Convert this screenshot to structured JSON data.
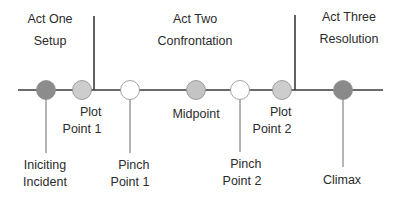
{
  "acts": [
    {
      "title": "Act One",
      "subtitle": "Setup"
    },
    {
      "title": "Act Two",
      "subtitle": "Confrontation"
    },
    {
      "title": "Act Three",
      "subtitle": "Resolution"
    }
  ],
  "points": [
    {
      "id": "inciting-incident",
      "line1": "Iniciting",
      "line2": "Incident",
      "fill": "#8c8c8c",
      "position": "below"
    },
    {
      "id": "plot-point-1",
      "line1": "Plot",
      "line2": "Point 1",
      "fill": "#cdcdcd",
      "position": "near"
    },
    {
      "id": "pinch-point-1",
      "line1": "Pinch",
      "line2": "Point 1",
      "fill": "#ffffff",
      "position": "below"
    },
    {
      "id": "midpoint",
      "line1": "Midpoint",
      "line2": "",
      "fill": "#c4c4c4",
      "position": "near"
    },
    {
      "id": "pinch-point-2",
      "line1": "Pinch",
      "line2": "Point 2",
      "fill": "#ffffff",
      "position": "below"
    },
    {
      "id": "plot-point-2",
      "line1": "Plot",
      "line2": "Point 2",
      "fill": "#cdcdcd",
      "position": "near"
    },
    {
      "id": "climax",
      "line1": "Climax",
      "line2": "",
      "fill": "#8a8a8a",
      "position": "below"
    }
  ],
  "colors": {
    "line": "#3a3a3a",
    "dark_node": "#8c8c8c",
    "light_node": "#cdcdcd",
    "empty_node": "#ffffff"
  }
}
